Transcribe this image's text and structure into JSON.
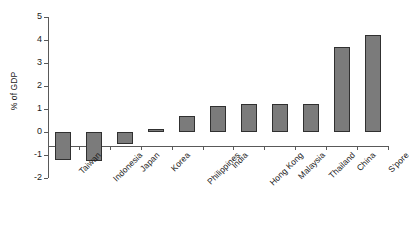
{
  "chart_data": {
    "type": "bar",
    "title": "",
    "subtitle": "",
    "xlabel": "",
    "ylabel": "% of GDP",
    "ylim": [
      -2,
      5
    ],
    "ytick_values": [
      5,
      4,
      3,
      2,
      1,
      0,
      -1,
      -2
    ],
    "ytick_labels": [
      "5",
      "4",
      "3",
      "2",
      "1",
      "0",
      "-1",
      "-2"
    ],
    "grid": false,
    "legend": false,
    "bar_color": "#7b7b7b",
    "bar_edge_color": "#303030",
    "axis_color": "#595959",
    "categories": [
      "Taiwan",
      "Indonesia",
      "Japan",
      "Korea",
      "Philippines",
      "India",
      "Hong Kong",
      "Malaysia",
      "Thailand",
      "China",
      "S'pore"
    ],
    "values": [
      -1.2,
      -1.25,
      -0.5,
      0.15,
      0.7,
      1.15,
      1.2,
      1.2,
      1.2,
      3.7,
      4.2
    ],
    "series": [
      {
        "name": "% of GDP",
        "values": [
          -1.2,
          -1.25,
          -0.5,
          0.15,
          0.7,
          1.15,
          1.2,
          1.2,
          1.2,
          3.7,
          4.2
        ]
      }
    ]
  }
}
